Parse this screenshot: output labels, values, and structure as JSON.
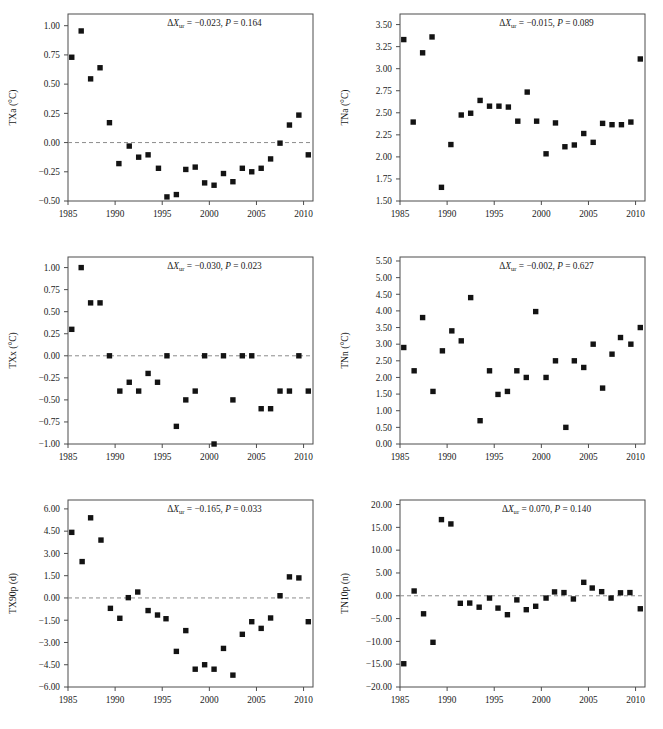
{
  "figure": {
    "background": "#ffffff",
    "marker_color": "#131313",
    "frame_color": "#4d4d4d",
    "zeroline_color": "#8c8c8c",
    "rows": 3,
    "cols": 2
  },
  "chart_data": [
    {
      "type": "scatter",
      "panel_id": "txa",
      "position": "top-left",
      "title": "",
      "xlabel": "",
      "ylabel": "TXa (°C)",
      "ylabel_parts": {
        "name": "TXa",
        "unit": "(°C)"
      },
      "annotation": "ΔXur = −0.023, P = 0.164",
      "annotation_parts": {
        "delta_symbol": "Δ",
        "var": "X",
        "sub": "ur",
        "eq": "=",
        "delta_value": "−0.023",
        "p_var": "P",
        "p_value": "0.164"
      },
      "grid": false,
      "zeroline": true,
      "zeroline_value": 0.0,
      "legend": "none",
      "xlim": [
        1985,
        2011
      ],
      "ylim": [
        -0.5,
        1.1
      ],
      "xticks": [
        1985,
        1990,
        1995,
        2000,
        2005,
        2010
      ],
      "xticklabels": [
        "1985",
        "1990",
        "1995",
        "2000",
        "2005",
        "2010"
      ],
      "yticks": [
        -0.5,
        -0.25,
        0.0,
        0.25,
        0.5,
        0.75,
        1.0
      ],
      "yticklabels": [
        "−0.50",
        "−0.25",
        "0.00",
        "0.25",
        "0.50",
        "0.75",
        "1.00"
      ],
      "x": [
        1985.4,
        1986.4,
        1987.4,
        1988.4,
        1989.4,
        1990.4,
        1991.5,
        1992.5,
        1993.5,
        1994.6,
        1995.5,
        1996.5,
        1997.5,
        1998.5,
        1999.5,
        2000.5,
        2001.5,
        2002.5,
        2003.5,
        2004.5,
        2005.5,
        2006.5,
        2007.5,
        2008.5,
        2009.5,
        2010.5
      ],
      "y": [
        0.73,
        0.955,
        0.545,
        0.64,
        0.17,
        -0.18,
        -0.03,
        -0.125,
        -0.105,
        -0.22,
        -0.465,
        -0.445,
        -0.23,
        -0.21,
        -0.345,
        -0.365,
        -0.265,
        -0.335,
        -0.22,
        -0.25,
        -0.22,
        -0.14,
        -0.005,
        0.15,
        0.235,
        -0.105
      ]
    },
    {
      "type": "scatter",
      "panel_id": "tna",
      "position": "top-right",
      "title": "",
      "xlabel": "",
      "ylabel": "TNa (°C)",
      "ylabel_parts": {
        "name": "TNa",
        "unit": "(°C)"
      },
      "annotation": "ΔXur = −0.015, P = 0.089",
      "annotation_parts": {
        "delta_symbol": "Δ",
        "var": "X",
        "sub": "ur",
        "eq": "=",
        "delta_value": "−0.015",
        "p_var": "P",
        "p_value": "0.089"
      },
      "grid": false,
      "zeroline": false,
      "legend": "none",
      "xlim": [
        1985,
        2011
      ],
      "ylim": [
        1.5,
        3.62
      ],
      "xticks": [
        1985,
        1990,
        1995,
        2000,
        2005,
        2010
      ],
      "xticklabels": [
        "1985",
        "1990",
        "1995",
        "2000",
        "2005",
        "2010"
      ],
      "yticks": [
        1.5,
        1.75,
        2.0,
        2.25,
        2.5,
        2.75,
        3.0,
        3.25,
        3.5
      ],
      "yticklabels": [
        "1.50",
        "1.75",
        "2.00",
        "2.25",
        "2.50",
        "2.75",
        "3.00",
        "3.25",
        "3.50"
      ],
      "x": [
        1985.4,
        1986.4,
        1987.4,
        1988.4,
        1989.4,
        1990.4,
        1991.5,
        1992.5,
        1993.5,
        1994.5,
        1995.5,
        1996.5,
        1997.5,
        1998.5,
        1999.5,
        2000.5,
        2001.5,
        2002.5,
        2003.5,
        2004.5,
        2005.5,
        2006.5,
        2007.5,
        2008.5,
        2009.5,
        2010.5
      ],
      "y": [
        3.33,
        2.395,
        3.18,
        3.36,
        1.655,
        2.14,
        2.475,
        2.495,
        2.64,
        2.575,
        2.575,
        2.565,
        2.405,
        2.735,
        2.405,
        2.035,
        2.385,
        2.115,
        2.135,
        2.265,
        2.165,
        2.38,
        2.365,
        2.365,
        2.395,
        3.11
      ]
    },
    {
      "type": "scatter",
      "panel_id": "txx",
      "position": "middle-left",
      "title": "",
      "xlabel": "",
      "ylabel": "TXx (°C)",
      "ylabel_parts": {
        "name": "TXx",
        "unit": "(°C)"
      },
      "annotation": "ΔXur = −0.030, P = 0.023",
      "annotation_parts": {
        "delta_symbol": "Δ",
        "var": "X",
        "sub": "ur",
        "eq": "=",
        "delta_value": "−0.030",
        "p_var": "P",
        "p_value": "0.023"
      },
      "grid": false,
      "zeroline": true,
      "zeroline_value": 0.0,
      "legend": "none",
      "xlim": [
        1985,
        2011
      ],
      "ylim": [
        -1.0,
        1.12
      ],
      "xticks": [
        1985,
        1990,
        1995,
        2000,
        2005,
        2010
      ],
      "xticklabels": [
        "1985",
        "1990",
        "1995",
        "2000",
        "2005",
        "2010"
      ],
      "yticks": [
        -1.0,
        -0.75,
        -0.5,
        -0.25,
        0.0,
        0.25,
        0.5,
        0.75,
        1.0
      ],
      "yticklabels": [
        "−1.00",
        "−0.75",
        "−0.50",
        "−0.25",
        "0.00",
        "0.25",
        "0.50",
        "0.75",
        "1.00"
      ],
      "x": [
        1985.4,
        1986.4,
        1987.4,
        1988.4,
        1989.4,
        1990.5,
        1991.5,
        1992.5,
        1993.5,
        1994.5,
        1995.5,
        1996.5,
        1997.5,
        1998.5,
        1999.5,
        2000.5,
        2001.5,
        2002.5,
        2003.5,
        2004.5,
        2005.5,
        2006.5,
        2007.5,
        2008.5,
        2009.5,
        2010.5
      ],
      "y": [
        0.3,
        1.0,
        0.6,
        0.6,
        0.0,
        -0.4,
        -0.3,
        -0.4,
        -0.2,
        -0.3,
        0.0,
        -0.8,
        -0.5,
        -0.4,
        0.0,
        -1.0,
        0.0,
        -0.5,
        0.0,
        0.0,
        -0.6,
        -0.6,
        -0.4,
        -0.4,
        0.0,
        -0.4
      ]
    },
    {
      "type": "scatter",
      "panel_id": "tnn",
      "position": "middle-right",
      "title": "",
      "xlabel": "",
      "ylabel": "TNn (°C)",
      "ylabel_parts": {
        "name": "TNn",
        "unit": "(°C)"
      },
      "annotation": "ΔXur = −0.002, P = 0.627",
      "annotation_parts": {
        "delta_symbol": "Δ",
        "var": "X",
        "sub": "ur",
        "eq": "=",
        "delta_value": "−0.002",
        "p_var": "P",
        "p_value": "0.627"
      },
      "grid": false,
      "zeroline": false,
      "legend": "none",
      "xlim": [
        1985,
        2011
      ],
      "ylim": [
        0.0,
        5.62
      ],
      "xticks": [
        1985,
        1990,
        1995,
        2000,
        2005,
        2010
      ],
      "xticklabels": [
        "1985",
        "1990",
        "1995",
        "2000",
        "2005",
        "2010"
      ],
      "yticks": [
        0.0,
        0.5,
        1.0,
        1.5,
        2.0,
        2.5,
        3.0,
        3.5,
        4.0,
        4.5,
        5.0,
        5.5
      ],
      "yticklabels": [
        "0.00",
        "0.50",
        "1.00",
        "1.50",
        "2.00",
        "2.50",
        "3.00",
        "3.50",
        "4.00",
        "4.50",
        "5.00",
        "5.50"
      ],
      "x": [
        1985.4,
        1986.5,
        1987.4,
        1988.5,
        1989.5,
        1990.5,
        1991.5,
        1992.5,
        1993.5,
        1994.5,
        1995.4,
        1996.4,
        1997.4,
        1998.4,
        1999.4,
        2000.5,
        2001.5,
        2003.5,
        2002.6,
        2004.5,
        2005.5,
        2006.5,
        2007.5,
        2008.4,
        2009.5,
        2010.5
      ],
      "y": [
        2.9,
        2.2,
        3.8,
        1.58,
        2.8,
        3.4,
        3.1,
        4.4,
        0.7,
        2.2,
        1.49,
        1.58,
        2.2,
        2.0,
        3.98,
        2.0,
        2.5,
        2.5,
        0.5,
        2.3,
        3.0,
        1.68,
        2.7,
        3.2,
        3.0,
        3.5
      ]
    },
    {
      "type": "scatter",
      "panel_id": "tx90p",
      "position": "bottom-left",
      "title": "",
      "xlabel": "",
      "ylabel": "TX90p (d)",
      "ylabel_parts": {
        "name": "TX90p",
        "unit": "(d)"
      },
      "annotation": "ΔXur = −0.165, P = 0.033",
      "annotation_parts": {
        "delta_symbol": "Δ",
        "var": "X",
        "sub": "ur",
        "eq": "=",
        "delta_value": "−0.165",
        "p_var": "P",
        "p_value": "0.033"
      },
      "grid": false,
      "zeroline": true,
      "zeroline_value": 0.0,
      "legend": "none",
      "xlim": [
        1985,
        2011
      ],
      "ylim": [
        -6.0,
        6.6
      ],
      "xticks": [
        1985,
        1990,
        1995,
        2000,
        2005,
        2010
      ],
      "xticklabels": [
        "1985",
        "1990",
        "1995",
        "2000",
        "2005",
        "2010"
      ],
      "yticks": [
        -6.0,
        -4.5,
        -3.0,
        -1.5,
        0.0,
        1.5,
        3.0,
        4.5,
        6.0
      ],
      "yticklabels": [
        "−6.00",
        "−4.50",
        "−3.00",
        "−1.50",
        "0.00",
        "1.50",
        "3.00",
        "4.50",
        "6.00"
      ],
      "x": [
        1985.4,
        1986.5,
        1987.4,
        1988.5,
        1989.5,
        1990.5,
        1991.4,
        1992.4,
        1993.5,
        1994.5,
        1995.4,
        1996.5,
        1997.5,
        1998.5,
        1999.5,
        2000.5,
        2001.5,
        2002.5,
        2003.5,
        2004.5,
        2005.5,
        2006.5,
        2007.5,
        2008.5,
        2009.5,
        2010.5
      ],
      "y": [
        4.42,
        2.45,
        5.4,
        3.9,
        -0.7,
        -1.37,
        0.02,
        0.4,
        -0.85,
        -1.15,
        -1.4,
        -3.6,
        -2.2,
        -4.8,
        -4.5,
        -4.8,
        -3.4,
        -5.2,
        -2.45,
        -1.6,
        -2.05,
        -1.35,
        0.15,
        1.42,
        1.35,
        -1.6
      ]
    },
    {
      "type": "scatter",
      "panel_id": "tn10p",
      "position": "bottom-right",
      "title": "",
      "xlabel": "",
      "ylabel": "TN10p (n)",
      "ylabel_parts": {
        "name": "TN10p",
        "unit": "(n)"
      },
      "annotation": "ΔXur = 0.070, P = 0.140",
      "annotation_parts": {
        "delta_symbol": "Δ",
        "var": "X",
        "sub": "ur",
        "eq": "=",
        "delta_value": "0.070",
        "p_var": "P",
        "p_value": "0.140"
      },
      "grid": false,
      "zeroline": true,
      "zeroline_value": 0.0,
      "legend": "none",
      "xlim": [
        1985,
        2011
      ],
      "ylim": [
        -20.0,
        21.0
      ],
      "xticks": [
        1985,
        1990,
        1995,
        2000,
        2005,
        2010
      ],
      "xticklabels": [
        "1985",
        "1990",
        "1995",
        "2000",
        "2005",
        "2010"
      ],
      "yticks": [
        -20.0,
        -15.0,
        -10.0,
        -5.0,
        0.0,
        5.0,
        10.0,
        15.0,
        20.0
      ],
      "yticklabels": [
        "−20.00",
        "−15.00",
        "−10.00",
        "−5.00",
        "0.00",
        "5.00",
        "10.00",
        "15.00",
        "20.00"
      ],
      "x": [
        1985.4,
        1986.5,
        1987.5,
        1988.5,
        1989.4,
        1990.4,
        1991.4,
        1992.4,
        1993.4,
        1994.5,
        1995.4,
        1996.4,
        1997.4,
        1998.4,
        1999.4,
        2000.5,
        2001.4,
        2002.4,
        2003.4,
        2004.5,
        2005.4,
        2006.4,
        2007.4,
        2008.4,
        2009.4,
        2010.5
      ],
      "y": [
        -14.9,
        1.05,
        -3.95,
        -10.2,
        16.7,
        15.75,
        -1.65,
        -1.6,
        -2.5,
        -0.5,
        -2.7,
        -4.15,
        -0.9,
        -3.05,
        -2.3,
        -0.5,
        0.85,
        0.7,
        -0.7,
        2.95,
        1.7,
        0.9,
        -0.5,
        0.65,
        0.7,
        -2.85
      ]
    }
  ]
}
